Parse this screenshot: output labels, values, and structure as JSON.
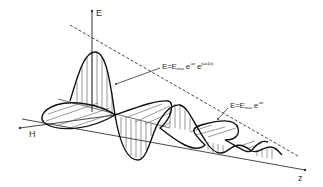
{
  "diagram": {
    "title": "",
    "type": "attenuated electromagnetic wave propagation",
    "axes": {
      "e_label": "E",
      "h_label": "H",
      "z_label": "z"
    },
    "equations": {
      "wave": {
        "lhs": "E=E",
        "sub": "max",
        "exp1_base": " e",
        "exp1": "-αz",
        "exp2_base": " e",
        "exp2": "j(ωt-βz)"
      },
      "envelope": {
        "lhs": "E=E",
        "sub": "max",
        "exp1_base": " e",
        "exp1": "-αz"
      }
    },
    "colors": {
      "line": "#1a1a1a",
      "hatch": "#555555",
      "text": "#333333",
      "background": "#ffffff"
    }
  }
}
